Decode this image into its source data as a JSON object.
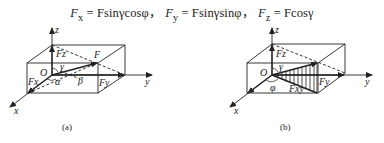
{
  "formula": {
    "text": "Fx = Fsinγcosφ, Fy = Fsinγsinφ, Fz = Fcosγ",
    "parts": [
      {
        "lhs": "F",
        "sub": "x",
        "rhs": "Fsinγcosφ"
      },
      {
        "lhs": "F",
        "sub": "y",
        "rhs": "Fsinγsinφ"
      },
      {
        "lhs": "F",
        "sub": "z",
        "rhs": "Fcosγ"
      }
    ],
    "separator": "，"
  },
  "figures": [
    {
      "id": "a",
      "caption": "(a)",
      "labels": {
        "z": "z",
        "y": "y",
        "x": "x",
        "origin": "O",
        "force": "F",
        "fz": "Fz",
        "fy": "Fy",
        "fx": "Fx",
        "alpha": "α",
        "beta": "β",
        "gamma": "γ"
      }
    },
    {
      "id": "b",
      "caption": "(b)",
      "labels": {
        "z": "z",
        "y": "y",
        "x": "x",
        "origin": "O",
        "fz": "Fz",
        "fy": "Fy",
        "fxy": "Fxy",
        "phi": "φ",
        "gamma": "γ"
      }
    }
  ]
}
